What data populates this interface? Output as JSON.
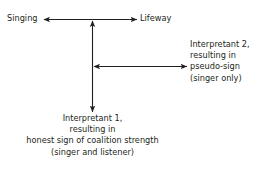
{
  "diagram": {
    "type": "semiotic-arrow-diagram",
    "background_color": "#ffffff",
    "stroke_color": "#231f20",
    "text_color": "#231f20",
    "labels": {
      "singing": "Singing",
      "lifeway": "Lifeway"
    },
    "interpretant_2": {
      "lines": [
        "Interpretant 2,",
        "resulting in",
        "pseudo-sign",
        "(singer only)"
      ]
    },
    "interpretant_1": {
      "lines": [
        "Interpretant 1,",
        "resulting in",
        "honest sign of coalition strength",
        "(singer and listener)"
      ]
    },
    "arrows": [
      {
        "name": "singing-lifeway-arrow",
        "orientation": "horizontal",
        "double_headed": true,
        "x1": 44,
        "y1": 19,
        "x2": 137,
        "y2": 19
      },
      {
        "name": "lifeway-interpretant1-arrow",
        "orientation": "vertical",
        "double_headed": true,
        "x1": 92,
        "y1": 21,
        "x2": 92,
        "y2": 112
      },
      {
        "name": "interpretant2-arrow",
        "orientation": "horizontal",
        "double_headed": true,
        "x1": 93,
        "y1": 66,
        "x2": 187,
        "y2": 66
      }
    ]
  }
}
